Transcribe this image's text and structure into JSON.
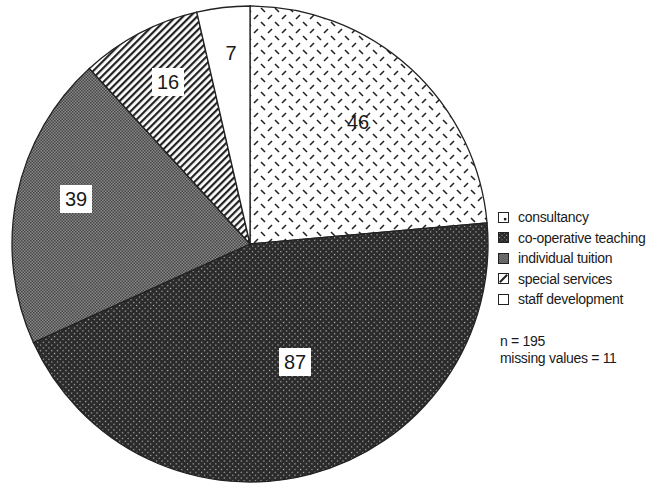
{
  "chart_data": {
    "type": "pie",
    "title": "",
    "start_angle": "12 o'clock",
    "direction": "clockwise",
    "categories": [
      "consultancy",
      "co-operative teaching",
      "individual tuition",
      "special services",
      "staff development"
    ],
    "values": [
      46,
      87,
      39,
      16,
      7
    ],
    "data_labels": [
      "46",
      "87",
      "39",
      "16",
      "7"
    ],
    "patterns": [
      "sparse dashed diagonals (light)",
      "dense diagonal hatch (dark)",
      "checker stipple (medium gray)",
      "diagonal stripes",
      "solid white"
    ],
    "legend_position": "right",
    "annotations": [
      "n = 195",
      "missing values = 11"
    ]
  },
  "legend": {
    "items": [
      {
        "label": "consultancy"
      },
      {
        "label": "co-operative teaching"
      },
      {
        "label": "individual tuition"
      },
      {
        "label": "special services"
      },
      {
        "label": "staff development"
      }
    ]
  },
  "notes": {
    "n": "n = 195",
    "missing": "missing values = 11"
  },
  "colors": {
    "outline": "#222222",
    "background": "#ffffff"
  }
}
